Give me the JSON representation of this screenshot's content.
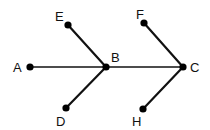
{
  "diagram": {
    "type": "graph",
    "nodes": [
      {
        "id": "A",
        "label": "A",
        "x": 30,
        "y": 67,
        "lx": 13,
        "ly": 72
      },
      {
        "id": "B",
        "label": "B",
        "x": 106,
        "y": 67,
        "lx": 111,
        "ly": 62
      },
      {
        "id": "C",
        "label": "C",
        "x": 183,
        "y": 67,
        "lx": 190,
        "ly": 72
      },
      {
        "id": "D",
        "label": "D",
        "x": 66,
        "y": 108,
        "lx": 56,
        "ly": 126
      },
      {
        "id": "E",
        "label": "E",
        "x": 68,
        "y": 25,
        "lx": 55,
        "ly": 21
      },
      {
        "id": "F",
        "label": "F",
        "x": 144,
        "y": 23,
        "lx": 136,
        "ly": 19
      },
      {
        "id": "H",
        "label": "H",
        "x": 143,
        "y": 109,
        "lx": 132,
        "ly": 126
      }
    ],
    "edges": [
      {
        "from": "A",
        "to": "B"
      },
      {
        "from": "B",
        "to": "C"
      },
      {
        "from": "E",
        "to": "B"
      },
      {
        "from": "D",
        "to": "B"
      },
      {
        "from": "F",
        "to": "C"
      },
      {
        "from": "H",
        "to": "C"
      }
    ]
  }
}
